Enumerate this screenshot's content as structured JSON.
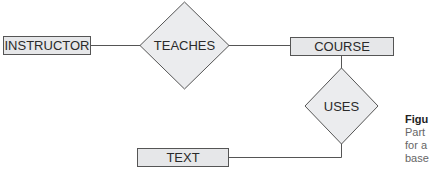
{
  "diagram": {
    "type": "entity-relationship",
    "entities": [
      {
        "id": "instructor",
        "label": "INSTRUCTOR"
      },
      {
        "id": "course",
        "label": "COURSE"
      },
      {
        "id": "text",
        "label": "TEXT"
      }
    ],
    "relationships": [
      {
        "id": "teaches",
        "label": "TEACHES",
        "from": "instructor",
        "to": "course"
      },
      {
        "id": "uses",
        "label": "USES",
        "from": "course",
        "to": "text"
      }
    ]
  },
  "caption": {
    "title": "Figu",
    "lines": [
      "Part",
      "for a",
      "base"
    ]
  },
  "colors": {
    "entity_fill": "#e6e7e9",
    "relationship_fill": "#ebecee",
    "stroke": "#555555"
  }
}
